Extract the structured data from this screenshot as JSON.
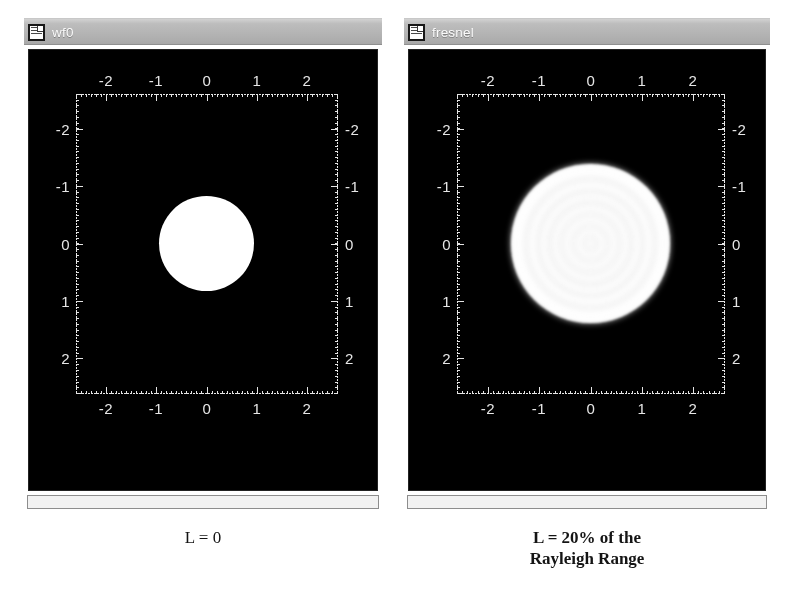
{
  "windows": [
    {
      "id": "wf0",
      "title": "wf0",
      "icon": "document-window-icon",
      "caption_line1": "L = 0",
      "caption_line2": ""
    },
    {
      "id": "fresnel",
      "title": "fresnel",
      "icon": "document-window-icon",
      "caption_line1": "L = 20% of the",
      "caption_line2": "Rayleigh Range"
    }
  ],
  "chart_data": [
    {
      "type": "heatmap",
      "name": "wf0",
      "title": "wf0",
      "xlabel": "",
      "ylabel": "",
      "xlim": [
        -2.6,
        2.6
      ],
      "ylim": [
        -2.6,
        2.6
      ],
      "xticks": [
        -2,
        -1,
        0,
        1,
        2
      ],
      "yticks": [
        -2,
        -1,
        0,
        1,
        2
      ],
      "xticklabels": [
        "-2",
        "-1",
        "0",
        "1",
        "2"
      ],
      "yticklabels": [
        "-2",
        "-1",
        "0",
        "1",
        "2"
      ],
      "xticklabels_top": [
        "-2",
        "-1",
        "0",
        "1",
        "2"
      ],
      "yticklabels_right": [
        "-2",
        "-1",
        "0",
        "1",
        "2"
      ],
      "grid": false,
      "minor_ticks": true,
      "background": "#000000",
      "foreground": "#e8e8e8",
      "description": "Uniform circular aperture (top-hat amplitude) at propagation distance L = 0",
      "features": [
        {
          "shape": "filled-circle",
          "center_x": 0.0,
          "center_y": 0.0,
          "radius": 0.95,
          "value": 1.0,
          "color": "#ffffff"
        }
      ]
    },
    {
      "type": "heatmap",
      "name": "fresnel",
      "title": "fresnel",
      "xlabel": "",
      "ylabel": "",
      "xlim": [
        -2.6,
        2.6
      ],
      "ylim": [
        -2.6,
        2.6
      ],
      "xticks": [
        -2,
        -1,
        0,
        1,
        2
      ],
      "yticks": [
        -2,
        -1,
        0,
        1,
        2
      ],
      "xticklabels": [
        "-2",
        "-1",
        "0",
        "1",
        "2"
      ],
      "yticklabels": [
        "-2",
        "-1",
        "0",
        "1",
        "2"
      ],
      "xticklabels_top": [
        "-2",
        "-1",
        "0",
        "1",
        "2"
      ],
      "yticklabels_right": [
        "-2",
        "-1",
        "0",
        "1",
        "2"
      ],
      "grid": false,
      "minor_ticks": true,
      "background": "#000000",
      "foreground": "#e8e8e8",
      "description": "Fresnel diffraction pattern of the circular aperture after propagating 20% of the Rayleigh range; concentric intensity rings with a bright outer annulus and diffuse noisy halo",
      "features": [
        {
          "shape": "concentric-rings",
          "center_x": 0.0,
          "center_y": 0.0,
          "outer_radius": 1.55,
          "bright_ring_radius": 1.0,
          "ring_count": 7,
          "color": "#ffffff"
        }
      ],
      "radial_profile": {
        "r": [
          0.0,
          0.08,
          0.16,
          0.24,
          0.32,
          0.4,
          0.48,
          0.56,
          0.64,
          0.72,
          0.8,
          0.88,
          0.96,
          1.04,
          1.12,
          1.25,
          1.4,
          1.55,
          1.7
        ],
        "intensity": [
          0.62,
          0.4,
          0.66,
          0.42,
          0.7,
          0.44,
          0.74,
          0.46,
          0.78,
          0.5,
          0.84,
          0.58,
          0.95,
          1.0,
          0.88,
          0.55,
          0.3,
          0.14,
          0.05
        ]
      }
    }
  ]
}
